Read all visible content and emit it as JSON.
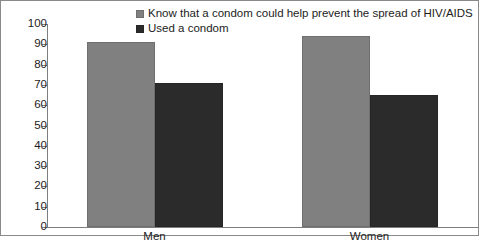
{
  "chart_data": {
    "type": "bar",
    "title": "",
    "xlabel": "",
    "ylabel": "",
    "categories": [
      "Men",
      "Women"
    ],
    "series": [
      {
        "name": "Know that a condom could help prevent the spread of HIV/AIDS",
        "values": [
          91,
          94
        ],
        "color": "#808080"
      },
      {
        "name": "Used a condom",
        "values": [
          71,
          65
        ],
        "color": "#2b2b2b"
      }
    ],
    "ylim": [
      0,
      100
    ],
    "yticks": [
      0,
      10,
      20,
      30,
      40,
      50,
      60,
      70,
      80,
      90,
      100
    ],
    "ytick_labels": [
      "0",
      "10",
      "20",
      "30",
      "40",
      "50",
      "60",
      "70",
      "80",
      "90",
      "100"
    ],
    "grid": false,
    "legend_position": "top-center"
  },
  "legend": {
    "items": [
      {
        "label": "Know that a condom could help prevent the spread of HIV/AIDS"
      },
      {
        "label": "Used a condom"
      }
    ]
  }
}
